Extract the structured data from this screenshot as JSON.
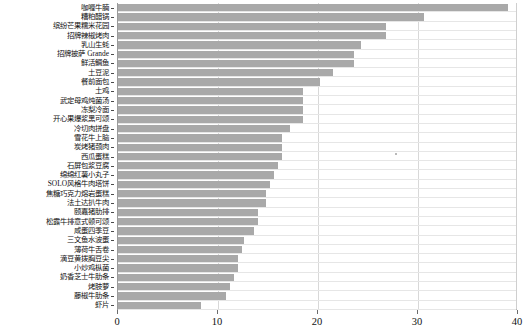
{
  "chart_data": {
    "type": "bar",
    "orientation": "horizontal",
    "title": "",
    "xlabel": "",
    "ylabel": "",
    "xlim": [
      0,
      40
    ],
    "xticks": [
      0,
      10,
      20,
      30,
      40
    ],
    "xtick_labels": [
      "0",
      "10",
      "20",
      "30",
      "40"
    ],
    "grid": true,
    "legend": "none",
    "bar_color": "#a9a9a9",
    "categories": [
      "咖喱牛腩",
      "糟粕醋锅",
      "缤纷芒果糯米花园",
      "招牌辣椒烤肉",
      "乳山生蚝",
      "招牌披萨 Grande",
      "鲜活鲷鱼",
      "土豆泥",
      "餐前面包",
      "土鸡",
      "武定母鸡炖菌汤",
      "冻梨冷面",
      "开心果爆浆黑可颂",
      "冷切肉拼盘",
      "雪花牛上脑",
      "炭烤猪颈肉",
      "西瓜蛋糕",
      "石屏包浆豆腐",
      "绵绵红薯小丸子",
      "SOLO风格牛肉塔饼",
      "焦糖巧克力熔岩蛋糕",
      "法土达扒牛肉",
      "颐嘉猪肋排",
      "松露牛排意式顿可颂",
      "咸蛋四季豆",
      "三文鱼水波蛋",
      "薄荷牛舌卷",
      "滴豆黄拨胸豆尖",
      "小炒鸡枞菌",
      "奶香芝士牛肋条",
      "烤肢萝",
      "藤椒牛肋条",
      "虾片"
    ],
    "values": [
      39.0,
      30.6,
      26.8,
      26.8,
      24.3,
      23.6,
      23.6,
      21.5,
      20.2,
      18.5,
      18.5,
      18.5,
      18.5,
      17.2,
      16.4,
      16.4,
      16.4,
      16.0,
      15.6,
      15.2,
      14.8,
      14.8,
      14.0,
      14.0,
      13.6,
      12.6,
      12.4,
      12.0,
      12.0,
      11.6,
      11.2,
      10.8,
      8.3
    ]
  }
}
